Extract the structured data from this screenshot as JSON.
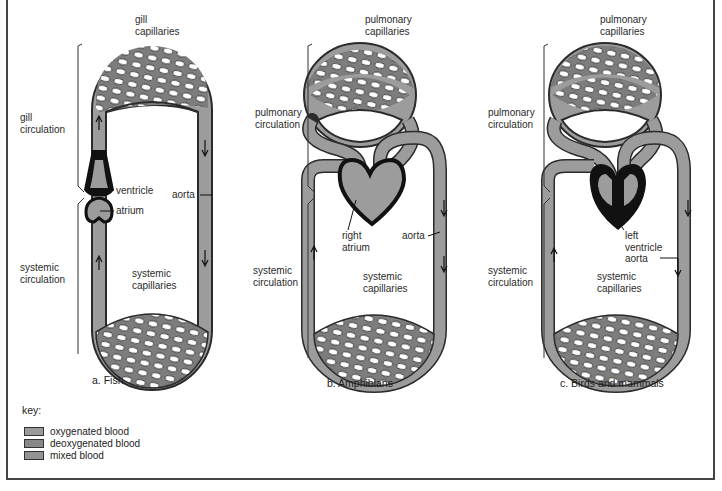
{
  "diagram": {
    "panels": [
      {
        "id": "fish",
        "caption": "a. Fish",
        "top_label": "gill\ncapillaries",
        "upper_circulation": "gill\ncirculation",
        "lower_circulation": "systemic\ncirculation",
        "bottom_label": "systemic\ncapillaries",
        "annotations": {
          "ventricle": "ventricle",
          "atrium": "atrium",
          "aorta": "aorta"
        }
      },
      {
        "id": "amphibians",
        "caption": "b. Amphibians",
        "top_label": "pulmonary\ncapillaries",
        "upper_circulation": "pulmonary\ncirculation",
        "lower_circulation": "systemic\ncirculation",
        "bottom_label": "systemic\ncapillaries",
        "annotations": {
          "right_atrium": "right\natrium",
          "aorta": "aorta"
        }
      },
      {
        "id": "birds_mammals",
        "caption": "c. Birds and mammals",
        "top_label": "pulmonary\ncapillaries",
        "upper_circulation": "pulmonary\ncirculation",
        "lower_circulation": "systemic\ncirculation",
        "bottom_label": "systemic\ncapillaries",
        "annotations": {
          "left_ventricle": "left\nventricle",
          "aorta": "aorta"
        }
      }
    ],
    "key": {
      "title": "key:",
      "items": [
        {
          "label": "oxygenated blood",
          "color": "#9a9a9a"
        },
        {
          "label": "deoxygenated blood",
          "color": "#888888"
        },
        {
          "label": "mixed blood",
          "color": "#939393"
        }
      ]
    },
    "colors": {
      "vessel_fill": "#9c9c9c",
      "vessel_outline": "#2b2b2b",
      "heart_wall": "#111111",
      "frame": "#444444"
    }
  }
}
